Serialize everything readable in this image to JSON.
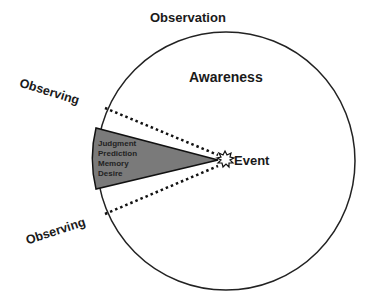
{
  "diagram": {
    "title": "Observation",
    "circle_label": "Awareness",
    "event_label": "Event",
    "observing_labels": [
      "Observing",
      "Observing"
    ],
    "wedge_items": [
      "Judgment",
      "Prediction",
      "Memory",
      "Desire"
    ],
    "colors": {
      "circle_stroke": "#222222",
      "wedge_fill": "#7a7a7a",
      "dotted_line": "#111111",
      "text": "#1a1a1a"
    }
  }
}
